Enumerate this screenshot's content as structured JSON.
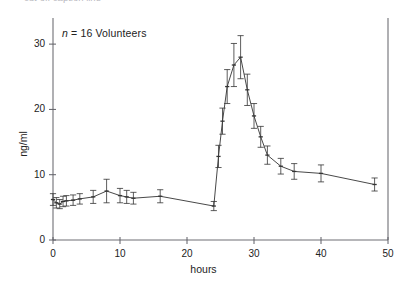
{
  "figure": {
    "clipped_header_text": "cut-off caption line",
    "annotation": {
      "prefix_italic": "n",
      "rest": " = 16 Volunteers"
    },
    "background_color": "#ffffff",
    "ink_color": "#333333"
  },
  "chart_data": {
    "type": "line",
    "title": "",
    "subtitle": "",
    "xlabel": "hours",
    "ylabel": "ng/ml",
    "xlim": [
      0,
      50
    ],
    "ylim": [
      0,
      34
    ],
    "xticks": [
      0,
      10,
      20,
      30,
      40,
      50
    ],
    "yticks": [
      0,
      10,
      20,
      30
    ],
    "xtick_labels": [
      "0",
      "10",
      "20",
      "30",
      "40",
      "50"
    ],
    "ytick_labels": [
      "0",
      "10",
      "20",
      "30"
    ],
    "grid": false,
    "legend": null,
    "annotations": [
      {
        "text": "n = 16 Volunteers",
        "x": 2.0,
        "y": 32.0
      }
    ],
    "error_bars": "symmetric (SEM), vertical, with caps",
    "marker": "small horizontal tick / dot",
    "series": [
      {
        "name": "Mean plasma concentration",
        "x": [
          0.0,
          0.5,
          1.0,
          1.5,
          2.0,
          3.0,
          4.0,
          6.0,
          8.0,
          10.0,
          11.0,
          12.0,
          16.0,
          24.0,
          24.7,
          25.3,
          26.0,
          27.0,
          28.0,
          29.0,
          30.0,
          31.0,
          32.0,
          34.0,
          36.0,
          40.0,
          48.0
        ],
        "y": [
          6.2,
          5.7,
          5.5,
          5.9,
          6.0,
          6.1,
          6.3,
          6.6,
          7.5,
          6.8,
          6.6,
          6.4,
          6.7,
          5.2,
          12.8,
          18.2,
          23.5,
          26.8,
          28.0,
          23.0,
          19.0,
          15.8,
          13.0,
          11.3,
          10.5,
          10.2,
          8.5
        ],
        "yerr": [
          0.9,
          0.8,
          0.7,
          0.8,
          0.8,
          0.8,
          0.8,
          1.0,
          1.8,
          1.1,
          1.0,
          0.9,
          1.0,
          0.7,
          1.7,
          2.0,
          2.6,
          3.3,
          3.3,
          2.4,
          1.9,
          1.6,
          1.4,
          1.2,
          1.2,
          1.3,
          1.0
        ]
      }
    ]
  },
  "axes_geometry": {
    "x0_px": 53,
    "x1_px": 388,
    "y0_px": 240,
    "ytop_px": 18,
    "px_per_hour": 6.7,
    "px_per_ngml": 5.68
  }
}
